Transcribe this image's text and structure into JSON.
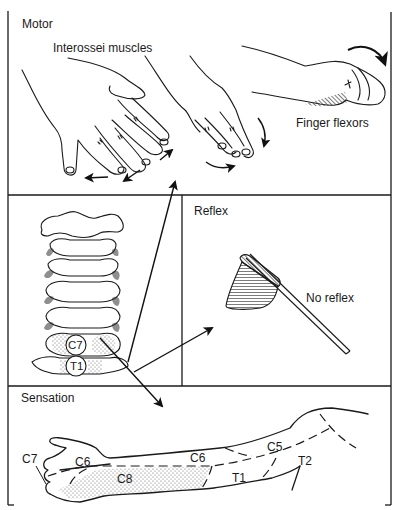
{
  "figure": {
    "panels": {
      "motor": {
        "heading": "Motor",
        "labels": {
          "interossei": "Interossei muscles",
          "finger_flexors": "Finger flexors"
        }
      },
      "spine": {
        "vertebra_labels": [
          "C7",
          "T1"
        ]
      },
      "reflex": {
        "heading": "Reflex",
        "labels": {
          "no_reflex": "No reflex"
        }
      },
      "sensation": {
        "heading": "Sensation",
        "dermatome_labels": {
          "c7": "C7",
          "c6_hand": "C6",
          "c8": "C8",
          "c6_forearm": "C6",
          "c5": "C5",
          "t1": "T1",
          "t2": "T2"
        }
      }
    },
    "colors": {
      "line": "#1a1a1a",
      "background": "#ffffff",
      "stipple": "#555555"
    }
  }
}
